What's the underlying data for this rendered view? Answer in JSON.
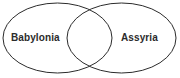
{
  "diagram": {
    "type": "venn-diagram-two-set",
    "background_color": "#ffffff",
    "outline_color": "#2b2b2b",
    "text_color": "#2b2b2b",
    "left_set": {
      "label": "Babylonia"
    },
    "right_set": {
      "label": "Assyria"
    },
    "intersection": {
      "label": ""
    }
  }
}
